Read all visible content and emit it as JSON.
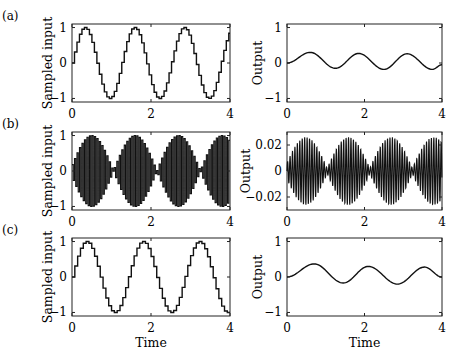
{
  "figure": {
    "rows": [
      {
        "label": "(a)"
      },
      {
        "label": "(b)"
      },
      {
        "label": "(c)"
      }
    ]
  },
  "chart_data": [
    {
      "panel": "(a) left",
      "type": "line",
      "style": "staircase (sample-and-hold)",
      "ylabel": "Sampled input",
      "xlabel": "",
      "xlim": [
        0,
        4
      ],
      "ylim": [
        -1.1,
        1.1
      ],
      "xticks": [
        0,
        2,
        4
      ],
      "yticks": [
        -1,
        0,
        1
      ],
      "description": "Sampled sinusoid, amplitude 1, ~3.2 periods over 0-4 (period ~1.26), ~20 steps per period",
      "peaks_x": [
        0.31,
        1.57,
        2.83
      ],
      "troughs_x": [
        0.94,
        2.2,
        3.46
      ],
      "grid": false
    },
    {
      "panel": "(a) right",
      "type": "line",
      "ylabel": "Output",
      "xlabel": "",
      "xlim": [
        0,
        4
      ],
      "ylim": [
        -1.1,
        1.1
      ],
      "xticks": [
        0,
        2,
        4
      ],
      "yticks": [
        -1,
        0,
        1
      ],
      "description": "Smooth output oscillation; values approximated from screenshot measurements, not computed from a known formula",
      "x": [
        0,
        0.6,
        1.25,
        1.85,
        2.5,
        3.1,
        3.75,
        4.0
      ],
      "y": [
        0,
        0.3,
        -0.15,
        0.27,
        -0.18,
        0.26,
        -0.18,
        -0.05
      ],
      "grid": false
    },
    {
      "panel": "(b) left",
      "type": "line",
      "style": "staircase (sample-and-hold), aliased",
      "ylabel": "Sampled input",
      "xlabel": "",
      "xlim": [
        0,
        4
      ],
      "ylim": [
        -1.1,
        1.1
      ],
      "xticks": [
        0,
        2,
        4
      ],
      "yticks": [
        -1,
        0,
        1
      ],
      "description": "High-frequency sampled signal alternating sign each sample; envelope |sin| with beat period ~1.1, ~4 lobes over 0-4",
      "grid": false
    },
    {
      "panel": "(b) right",
      "type": "line",
      "ylabel": "Output",
      "xlabel": "",
      "xlim": [
        0,
        4
      ],
      "ylim": [
        -0.03,
        0.03
      ],
      "xticks": [
        0,
        2,
        4
      ],
      "yticks": [
        -0.02,
        0,
        0.02
      ],
      "description": "Rapid oscillation with beating envelope, peak amplitude ~0.024, envelope maxima near t=0.6, 1.7, 2.8, 3.9",
      "grid": false
    },
    {
      "panel": "(c) left",
      "type": "line",
      "style": "staircase (sample-and-hold)",
      "ylabel": "Sampled input",
      "xlabel": "Time",
      "xlim": [
        0,
        4
      ],
      "ylim": [
        -1.1,
        1.1
      ],
      "xticks": [
        0,
        2,
        4
      ],
      "yticks": [
        -1,
        0,
        1
      ],
      "description": "Sampled sinusoid, amplitude 1, period ~1.43 (peaks near 0.36, 1.79, 3.21)",
      "peaks_x": [
        0.36,
        1.79,
        3.21
      ],
      "troughs_x": [
        1.07,
        2.5,
        3.93
      ],
      "grid": false
    },
    {
      "panel": "(c) right",
      "type": "line",
      "ylabel": "Output",
      "xlabel": "Time",
      "xlim": [
        0,
        4
      ],
      "ylim": [
        -1.1,
        1.1
      ],
      "xticks": [
        0,
        2,
        4
      ],
      "yticks": [
        -1,
        0,
        1
      ],
      "description": "Smooth output oscillation; values approximated from screenshot measurements, not computed from a known formula",
      "x": [
        0,
        0.7,
        1.45,
        2.1,
        2.85,
        3.55,
        4.0
      ],
      "y": [
        0,
        0.37,
        -0.17,
        0.3,
        -0.2,
        0.28,
        0.0
      ],
      "grid": false
    }
  ]
}
